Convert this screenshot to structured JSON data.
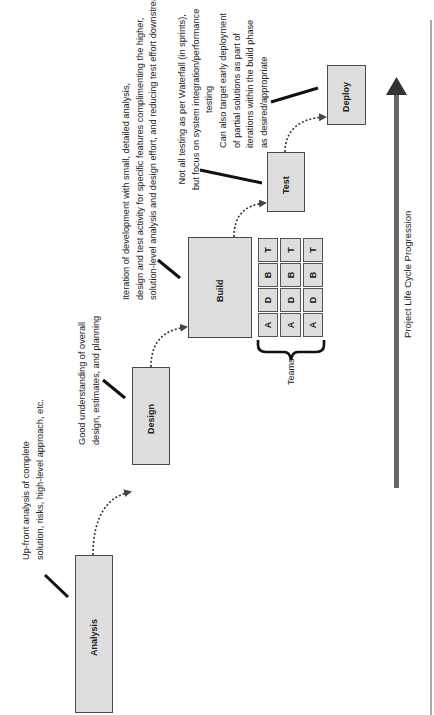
{
  "phases": [
    {
      "id": "analysis",
      "label": "Analysis"
    },
    {
      "id": "design",
      "label": "Design"
    },
    {
      "id": "build",
      "label": "Build"
    },
    {
      "id": "test",
      "label": "Test"
    },
    {
      "id": "deploy",
      "label": "Deploy"
    }
  ],
  "notes": {
    "analysis": "Up-front analysis of complete\nsolution, risks, high-level approach, etc.",
    "design": "Good understanding of overall\ndesign, estimates, and planning",
    "build": "Iteration of development with small, detailed analysis,\ndesign and test activity for specific features complimenting the higher,\nsolution-level analysis and design effort, and reducing test effort downstream",
    "test": "Not all testing as per Waterfall (in sprints),\nbut focus on system integration/performance\ntesting",
    "deploy": "Can also target early deployment\nof partial solutions as part of\niterations within the build phase\nas desired/appropriate"
  },
  "team_grid": {
    "columns": [
      "A",
      "D",
      "B",
      "T"
    ],
    "rows": 3,
    "row_labels": [
      [
        "A",
        "D",
        "B",
        "T"
      ],
      [
        "A",
        "D",
        "B",
        "T"
      ],
      [
        "A",
        "D",
        "B",
        "T"
      ]
    ]
  },
  "teams_label": "Teams",
  "axis_label": "Project Life Cycle Progression",
  "colors": {
    "box_fill": "#dedede",
    "border": "#4a4a4a",
    "arrow": "#555555"
  }
}
